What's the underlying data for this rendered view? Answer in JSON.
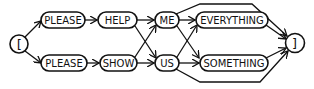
{
  "diagram": {
    "type": "railroad / syntax diagram",
    "start": {
      "label": "["
    },
    "end": {
      "label": "]"
    },
    "nodes": {
      "please_top": "PLEASE",
      "help": "HELP",
      "please_bottom": "PLEASE",
      "show": "SHOW",
      "me": "ME",
      "us": "US",
      "everything": "EVERYTHING",
      "something": "SOMETHING"
    },
    "edges": [
      [
        "[",
        "PLEASE (top)"
      ],
      [
        "[",
        "PLEASE (bottom)"
      ],
      [
        "PLEASE (top)",
        "HELP"
      ],
      [
        "PLEASE (bottom)",
        "SHOW"
      ],
      [
        "HELP",
        "ME"
      ],
      [
        "HELP",
        "US"
      ],
      [
        "SHOW",
        "ME"
      ],
      [
        "SHOW",
        "US"
      ],
      [
        "ME",
        "EVERYTHING"
      ],
      [
        "ME",
        "SOMETHING"
      ],
      [
        "US",
        "EVERYTHING"
      ],
      [
        "US",
        "SOMETHING"
      ],
      [
        "ME",
        "]"
      ],
      [
        "US",
        "]"
      ],
      [
        "EVERYTHING",
        "]"
      ],
      [
        "SOMETHING",
        "]"
      ]
    ],
    "colors": {
      "stroke": "#111111",
      "background": "#ffffff"
    }
  }
}
